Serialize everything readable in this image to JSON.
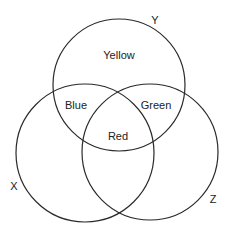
{
  "diagram": {
    "type": "venn",
    "sets": [
      {
        "id": "Y",
        "label": "Y",
        "cx": 119,
        "cy": 85,
        "r": 66,
        "label_pos": [
          155,
          24
        ]
      },
      {
        "id": "X",
        "label": "X",
        "cx": 85,
        "cy": 153,
        "r": 69,
        "label_pos": [
          14,
          190
        ]
      },
      {
        "id": "Z",
        "label": "Z",
        "cx": 150,
        "cy": 152,
        "r": 68,
        "label_pos": [
          213,
          203
        ]
      }
    ],
    "regions": [
      {
        "name": "yellow-region",
        "label": "Yellow",
        "sets": [
          "Y"
        ],
        "pos": [
          119,
          59
        ]
      },
      {
        "name": "blue-region",
        "label": "Blue",
        "sets": [
          "Y",
          "X"
        ],
        "pos": [
          76,
          109
        ]
      },
      {
        "name": "green-region",
        "label": "Green",
        "sets": [
          "Y",
          "Z"
        ],
        "pos": [
          156,
          109
        ]
      },
      {
        "name": "red-region",
        "label": "Red",
        "sets": [
          "Y",
          "X",
          "Z"
        ],
        "pos": [
          118,
          140
        ]
      }
    ]
  }
}
